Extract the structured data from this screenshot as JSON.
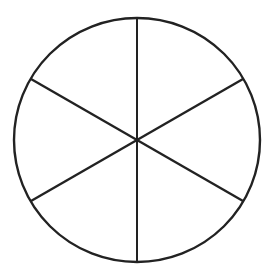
{
  "figure": {
    "name": "fraction-circle",
    "background_color": "#ffffff",
    "stroke_color": "#222222",
    "circle": {
      "center_x": 137,
      "center_y": 140,
      "radius_x": 123,
      "radius_y": 122,
      "stroke_width": 2.4,
      "fill": "#ffffff"
    },
    "sector_count": 6,
    "sector_angle_degrees": 60,
    "dividers": [
      {
        "name": "vertical-diameter",
        "angle_degrees": 90,
        "x1": 137,
        "y1": 18,
        "x2": 137,
        "y2": 262,
        "stroke_width": 2.0
      },
      {
        "name": "diagonal-diameter-nwse",
        "angle_degrees": 30,
        "x1": 31,
        "y1": 79,
        "x2": 243,
        "y2": 201,
        "stroke_width": 2.4
      },
      {
        "name": "diagonal-diameter-swne",
        "angle_degrees": 150,
        "x1": 31,
        "y1": 201,
        "x2": 243,
        "y2": 79,
        "stroke_width": 2.4
      }
    ],
    "sector_endpoints": [
      {
        "name": "top-vertex",
        "x": 137,
        "y": 18
      },
      {
        "name": "upper-right-vertex",
        "x": 243,
        "y": 79
      },
      {
        "name": "lower-right-vertex",
        "x": 243,
        "y": 201
      },
      {
        "name": "bottom-vertex",
        "x": 137,
        "y": 262
      },
      {
        "name": "lower-left-vertex",
        "x": 31,
        "y": 201
      },
      {
        "name": "upper-left-vertex",
        "x": 31,
        "y": 79
      }
    ]
  },
  "chart_data": {
    "type": "pie",
    "title": "",
    "subtitle": "",
    "xlabel": "",
    "ylabel": "",
    "categories": [
      "Sector 1",
      "Sector 2",
      "Sector 3",
      "Sector 4",
      "Sector 5",
      "Sector 6"
    ],
    "values": [
      1,
      1,
      1,
      1,
      1,
      1
    ],
    "slice_angles_degrees": [
      60,
      60,
      60,
      60,
      60,
      60
    ],
    "slice_fraction": "1/6",
    "total": 6,
    "shaded_count": 0,
    "legend": "none",
    "grid": false,
    "slice_fill_colors": [
      "#ffffff",
      "#ffffff",
      "#ffffff",
      "#ffffff",
      "#ffffff",
      "#ffffff"
    ],
    "outline_color": "#222222"
  }
}
